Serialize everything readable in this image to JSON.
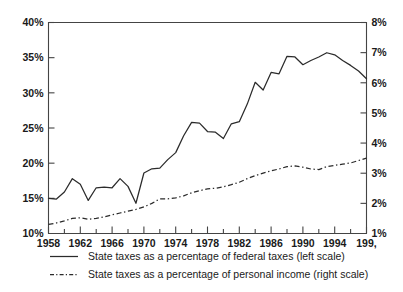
{
  "chart_data": {
    "type": "line",
    "title": "",
    "subtitle": "",
    "xlabel": "",
    "ylabel": "",
    "grid": false,
    "legend_position": "bottom-left",
    "x": [
      1958,
      1959,
      1960,
      1961,
      1962,
      1963,
      1964,
      1965,
      1966,
      1967,
      1968,
      1969,
      1970,
      1971,
      1972,
      1973,
      1974,
      1975,
      1976,
      1977,
      1978,
      1979,
      1980,
      1981,
      1982,
      1983,
      1984,
      1985,
      1986,
      1987,
      1988,
      1989,
      1990,
      1991,
      1992,
      1993,
      1994,
      1995,
      1996,
      1997,
      1998
    ],
    "x_tick_labels": [
      "1958",
      "1962",
      "1966",
      "1970",
      "1974",
      "1978",
      "1982",
      "1986",
      "1990",
      "1994",
      "199,"
    ],
    "x_tick_values": [
      1958,
      1962,
      1966,
      1970,
      1974,
      1978,
      1982,
      1986,
      1990,
      1994,
      1998
    ],
    "xlim": [
      1958,
      1998
    ],
    "left_axis": {
      "label": "",
      "ylim": [
        10,
        40
      ],
      "tick_labels": [
        "10%",
        "15%",
        "20%",
        "25%",
        "30%",
        "35%",
        "40%"
      ],
      "tick_values": [
        10,
        15,
        20,
        25,
        30,
        35,
        40
      ]
    },
    "right_axis": {
      "label": "",
      "ylim": [
        1,
        8
      ],
      "tick_labels": [
        "1%",
        "2%",
        "3%",
        "4%",
        "5%",
        "6%",
        "7%",
        "8%"
      ],
      "tick_values": [
        1,
        2,
        3,
        4,
        5,
        6,
        7,
        8
      ]
    },
    "series": [
      {
        "name": "State taxes as a percentage of federal taxes (left scale)",
        "axis": "left",
        "style": "solid",
        "color": "#2b2b2b",
        "values": [
          15.0,
          14.9,
          15.9,
          17.8,
          17.0,
          14.7,
          16.5,
          16.6,
          16.5,
          17.8,
          16.7,
          14.3,
          18.6,
          19.2,
          19.3,
          20.5,
          21.5,
          23.9,
          25.8,
          25.7,
          24.5,
          24.4,
          23.5,
          25.6,
          25.9,
          28.4,
          31.5,
          30.4,
          32.9,
          32.7,
          35.2,
          35.1,
          34.0,
          34.6,
          35.1,
          35.7,
          35.4,
          34.6,
          33.9,
          33.1,
          32.0
        ]
      },
      {
        "name": "State taxes as a percentage of personal income (right scale)",
        "axis": "right",
        "style": "dash-dot",
        "color": "#2b2b2b",
        "values": [
          1.3,
          1.35,
          1.42,
          1.5,
          1.52,
          1.47,
          1.5,
          1.55,
          1.62,
          1.68,
          1.74,
          1.8,
          1.88,
          2.0,
          2.15,
          2.15,
          2.18,
          2.25,
          2.35,
          2.42,
          2.48,
          2.5,
          2.55,
          2.62,
          2.7,
          2.82,
          2.92,
          3.0,
          3.08,
          3.14,
          3.22,
          3.24,
          3.2,
          3.14,
          3.12,
          3.22,
          3.26,
          3.3,
          3.34,
          3.42,
          3.5
        ]
      }
    ]
  },
  "legend": {
    "items": [
      {
        "label": "State taxes as a percentage of federal taxes (left scale)",
        "style": "solid"
      },
      {
        "label": "State taxes as a percentage of personal income (right scale)",
        "style": "dash-dot"
      }
    ]
  }
}
